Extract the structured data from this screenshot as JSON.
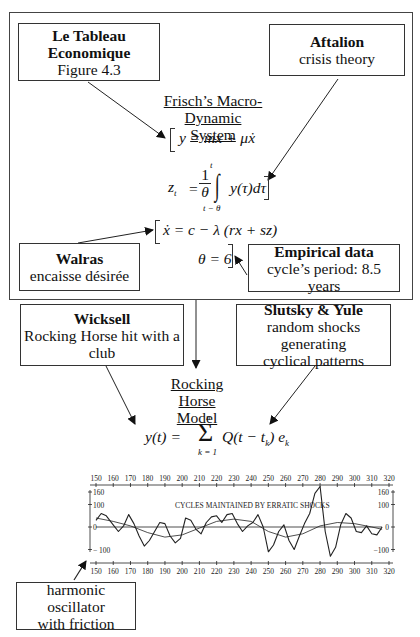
{
  "boxes": {
    "tableau": {
      "title": "Le Tableau Economique",
      "subtitle": "Figure 4.3"
    },
    "aftalion": {
      "title": "Aftalion",
      "subtitle": "crisis theory"
    },
    "walras": {
      "title": "Walras",
      "subtitle": "encaisse désirée"
    },
    "empirical": {
      "title": "Empirical data",
      "subtitle": "cycle’s period: 8.5 years"
    },
    "wicksell": {
      "title": "Wicksell",
      "subtitle1": "Rocking Horse hit with a",
      "subtitle2": "club"
    },
    "slutsky": {
      "title": "Slutsky & Yule",
      "subtitle1": "random shocks generating",
      "subtitle2": "cyclical patterns"
    },
    "oscillator": {
      "line1": "harmonic oscillator",
      "line2": "with friction"
    }
  },
  "frisch": {
    "title1": "Frisch’s Macro-",
    "title2": "Dynamic System",
    "eq1": "y = mx + μẋ",
    "eq2_lhs": "z",
    "eq2_sub": "t",
    "eq2_frac_num": "1",
    "eq2_frac_den": "θ",
    "eq2_int_upper": "t",
    "eq2_int_lower": "t − θ",
    "eq2_body": "y(τ)dτ",
    "eq3": "ẋ = c − λ (rx + sz)",
    "eq4": "θ = 6"
  },
  "rocking_horse": {
    "title1": "Rocking Horse",
    "title2": "Model",
    "eq_lhs": "y(t) = ",
    "eq_sum_upper": "n",
    "eq_sum_lower": "k = 1",
    "eq_body": "Q(t − t",
    "eq_body_sub": "k",
    "eq_body_end": ") e",
    "eq_e_sub": "k"
  },
  "chart_data": {
    "type": "line",
    "title": "CYCLES MAINTAINED BY ERRATIC SHOCKS",
    "xlabel": "",
    "ylabel": "",
    "x_ticks": [
      150,
      160,
      170,
      180,
      190,
      200,
      210,
      220,
      230,
      240,
      250,
      260,
      270,
      280,
      290,
      300,
      310,
      320
    ],
    "y_ticks_left": [
      160,
      100,
      0,
      -100
    ],
    "y_ticks_left_labels": [
      "160",
      "100",
      "0",
      "− 100"
    ],
    "y_ticks_right_labels": [
      "160",
      "100",
      "0",
      "−100"
    ],
    "xlim": [
      150,
      320
    ],
    "ylim": [
      -130,
      170
    ],
    "grid": false,
    "series": [
      {
        "name": "erratic cycle",
        "x": [
          150,
          153,
          156,
          160,
          163,
          166,
          169,
          172,
          175,
          178,
          181,
          184,
          187,
          190,
          193,
          196,
          199,
          202,
          205,
          208,
          211,
          214,
          217,
          220,
          223,
          226,
          229,
          232,
          235,
          238,
          241,
          244,
          247,
          250,
          253,
          256,
          259,
          262,
          265,
          268,
          271,
          274,
          277,
          280,
          283,
          286,
          289,
          292,
          295,
          298,
          301,
          304,
          307,
          310,
          313,
          316
        ],
        "y": [
          30,
          60,
          50,
          10,
          -20,
          5,
          55,
          15,
          -40,
          -85,
          -60,
          -20,
          20,
          15,
          -40,
          -70,
          -50,
          40,
          30,
          -10,
          -30,
          20,
          45,
          50,
          20,
          55,
          60,
          15,
          -20,
          5,
          20,
          55,
          0,
          -110,
          -80,
          -20,
          10,
          -60,
          -100,
          -40,
          15,
          60,
          150,
          180,
          -20,
          -130,
          -90,
          10,
          60,
          40,
          -20,
          -25,
          5,
          -30,
          -35,
          0
        ]
      },
      {
        "name": "damped harmonic",
        "x": [
          150,
          160,
          170,
          180,
          190,
          200,
          210,
          220,
          230,
          240,
          250,
          260,
          270,
          280,
          290,
          300,
          310,
          316
        ],
        "y": [
          40,
          25,
          5,
          -25,
          -45,
          -35,
          -5,
          25,
          35,
          25,
          -20,
          -45,
          -30,
          5,
          20,
          15,
          0,
          -10
        ]
      },
      {
        "name": "zero line",
        "x": [
          150,
          316
        ],
        "y": [
          0,
          0
        ]
      }
    ]
  },
  "colors": {
    "line": "#222222",
    "frame": "#444444",
    "background": "#ffffff"
  }
}
